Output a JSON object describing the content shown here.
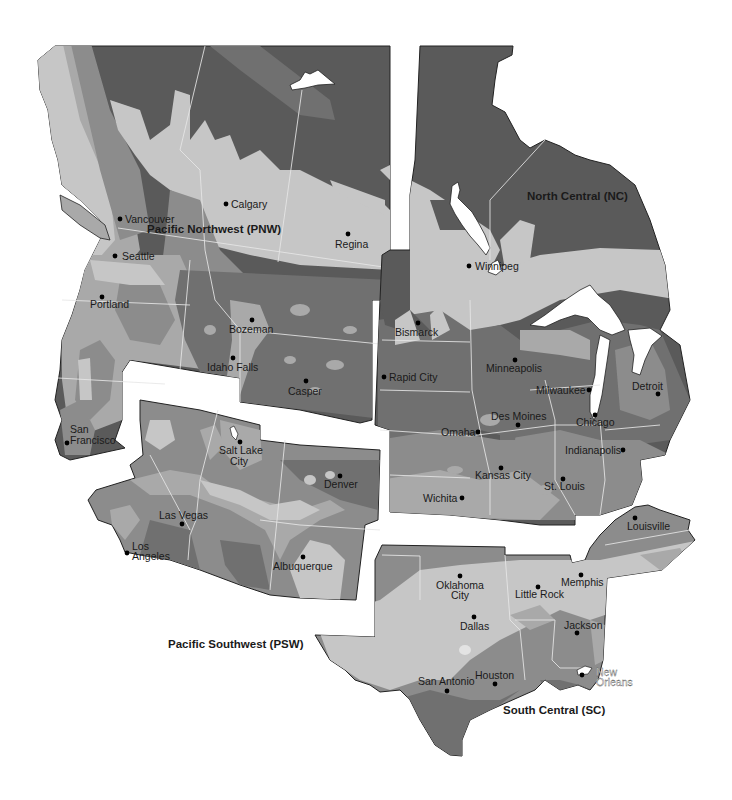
{
  "map": {
    "type": "regional shaded relief/zone map",
    "palette": {
      "darkest": "#5a5a5a",
      "dark": "#707070",
      "mid": "#8c8c8c",
      "light": "#a9a9a9",
      "lightest": "#c6c6c6",
      "water": "#ffffff",
      "background": "#ffffff"
    },
    "regions": [
      {
        "id": "pnw",
        "label": "Pacific Northwest (PNW)"
      },
      {
        "id": "nc",
        "label": "North Central (NC)"
      },
      {
        "id": "psw",
        "label": "Pacific Southwest (PSW)"
      },
      {
        "id": "sc",
        "label": "South Central (SC)"
      }
    ],
    "cities": {
      "vancouver": "Vancouver",
      "calgary": "Calgary",
      "regina": "Regina",
      "seattle": "Seattle",
      "portland": "Portland",
      "bozeman": "Bozeman",
      "idaho_falls": "Idaho Falls",
      "casper": "Casper",
      "san": "San",
      "francisco": "Francisco",
      "winnipeg": "Winnipeg",
      "bismarck": "Bismarck",
      "rapid_city": "Rapid City",
      "minneapolis": "Minneapolis",
      "milwaukee": "Milwaukee",
      "detroit": "Detroit",
      "des_moines": "Des Moines",
      "omaha": "Omaha",
      "chicago": "Chicago",
      "indianapolis": "Indianapolis",
      "kansas_city": "Kansas City",
      "st_louis": "St. Louis",
      "wichita": "Wichita",
      "salt": "Salt Lake",
      "lake_city": "City",
      "denver": "Denver",
      "las_vegas": "Las Vegas",
      "los": "Los",
      "angeles": "Angeles",
      "albuquerque": "Albuquerque",
      "louisville": "Louisville",
      "oklahoma": "Oklahoma",
      "oklahoma_city": "City",
      "little_rock": "Little Rock",
      "memphis": "Memphis",
      "dallas": "Dallas",
      "jackson": "Jackson",
      "san_antonio": "San Antonio",
      "houston": "Houston",
      "new": "New",
      "orleans": "Orleans"
    }
  }
}
